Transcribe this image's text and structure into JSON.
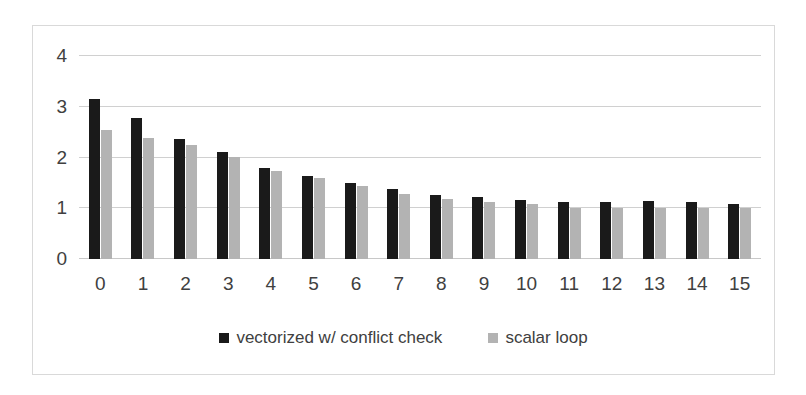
{
  "chart_data": {
    "type": "bar",
    "title": "",
    "subtitle": "",
    "xlabel": "",
    "ylabel": "",
    "categories": [
      "0",
      "1",
      "2",
      "3",
      "4",
      "5",
      "6",
      "7",
      "8",
      "9",
      "10",
      "11",
      "12",
      "13",
      "14",
      "15"
    ],
    "series": [
      {
        "name": "vectorized w/ conflict check",
        "color": "#1a1a1a",
        "values": [
          3.15,
          2.78,
          2.37,
          2.1,
          1.8,
          1.63,
          1.5,
          1.37,
          1.27,
          1.23,
          1.16,
          1.13,
          1.13,
          1.14,
          1.13,
          1.09
        ]
      },
      {
        "name": "scalar loop",
        "color": "#b3b3b3",
        "values": [
          2.55,
          2.38,
          2.25,
          2.02,
          1.73,
          1.6,
          1.44,
          1.29,
          1.19,
          1.13,
          1.09,
          1.01,
          1.01,
          1.0,
          1.0,
          1.0
        ]
      }
    ],
    "ylim": [
      0,
      4
    ],
    "yticks": [
      0,
      1,
      2,
      3,
      4
    ],
    "ytick_labels": [
      "0",
      "1",
      "2",
      "3",
      "4"
    ],
    "grid": true,
    "legend_position": "bottom",
    "bar_group_count": 16
  },
  "legend": {
    "entries": [
      {
        "label": "vectorized w/ conflict check",
        "color": "#1a1a1a"
      },
      {
        "label": "scalar loop",
        "color": "#b3b3b3"
      }
    ]
  },
  "colors": {
    "series_dark": "#1a1a1a",
    "series_light": "#b3b3b3",
    "gridline": "#d0d0d0",
    "frame_border": "#d9d9d9",
    "text": "#404040",
    "background": "#ffffff"
  }
}
